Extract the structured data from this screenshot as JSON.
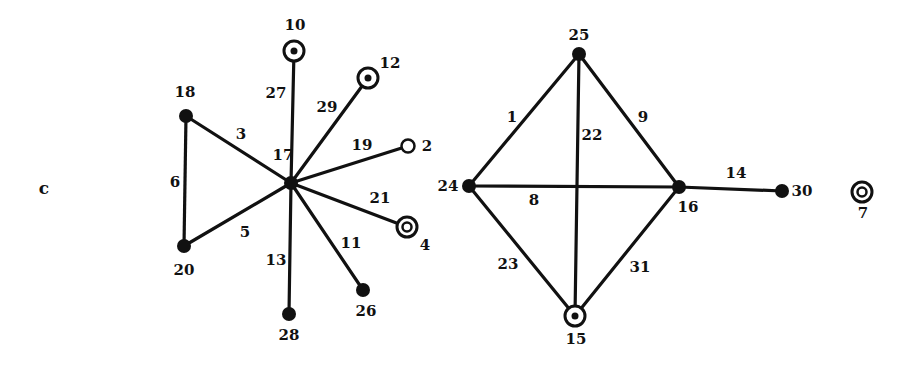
{
  "panel_label": "c",
  "colors": {
    "ink": "#111111",
    "background": "#ffffff"
  },
  "node_types": {
    "filled": "solid black dot",
    "dotted-ring": "ring with central dot",
    "double-ring": "double concentric ring",
    "open": "open circle"
  },
  "nodes": [
    {
      "id": "17",
      "label": "17",
      "type": "filled",
      "x": 291,
      "y": 183,
      "lx": 283,
      "ly": 160
    },
    {
      "id": "18",
      "label": "18",
      "type": "filled",
      "x": 186,
      "y": 116,
      "lx": 185,
      "ly": 97
    },
    {
      "id": "20",
      "label": "20",
      "type": "filled",
      "x": 184,
      "y": 246,
      "lx": 184,
      "ly": 275
    },
    {
      "id": "10",
      "label": "10",
      "type": "dotted-ring",
      "x": 294,
      "y": 51,
      "lx": 295,
      "ly": 30
    },
    {
      "id": "12",
      "label": "12",
      "type": "dotted-ring",
      "x": 368,
      "y": 78,
      "lx": 390,
      "ly": 68
    },
    {
      "id": "2",
      "label": "2",
      "type": "open",
      "x": 408,
      "y": 146,
      "lx": 427,
      "ly": 151
    },
    {
      "id": "4",
      "label": "4",
      "type": "double-ring",
      "x": 407,
      "y": 227,
      "lx": 425,
      "ly": 250
    },
    {
      "id": "26",
      "label": "26",
      "type": "filled",
      "x": 363,
      "y": 290,
      "lx": 366,
      "ly": 316
    },
    {
      "id": "28",
      "label": "28",
      "type": "filled",
      "x": 289,
      "y": 314,
      "lx": 289,
      "ly": 340
    },
    {
      "id": "25",
      "label": "25",
      "type": "filled",
      "x": 579,
      "y": 54,
      "lx": 579,
      "ly": 40
    },
    {
      "id": "24",
      "label": "24",
      "type": "filled",
      "x": 469,
      "y": 186,
      "lx": 448,
      "ly": 191
    },
    {
      "id": "16",
      "label": "16",
      "type": "filled",
      "x": 679,
      "y": 187,
      "lx": 688,
      "ly": 212
    },
    {
      "id": "15",
      "label": "15",
      "type": "dotted-ring",
      "x": 575,
      "y": 316,
      "lx": 576,
      "ly": 344
    },
    {
      "id": "30",
      "label": "30",
      "type": "filled",
      "x": 782,
      "y": 191,
      "lx": 802,
      "ly": 196
    },
    {
      "id": "7",
      "label": "7",
      "type": "double-ring",
      "x": 862,
      "y": 192,
      "lx": 863,
      "ly": 218
    }
  ],
  "edges": [
    {
      "id": "3",
      "label": "3",
      "from": "18",
      "to": "17",
      "lx": 241,
      "ly": 139
    },
    {
      "id": "6",
      "label": "6",
      "from": "18",
      "to": "20",
      "lx": 175,
      "ly": 187
    },
    {
      "id": "5",
      "label": "5",
      "from": "20",
      "to": "17",
      "lx": 245,
      "ly": 237
    },
    {
      "id": "27",
      "label": "27",
      "from": "10",
      "to": "17",
      "lx": 276,
      "ly": 98
    },
    {
      "id": "29",
      "label": "29",
      "from": "12",
      "to": "17",
      "lx": 327,
      "ly": 112
    },
    {
      "id": "19",
      "label": "19",
      "from": "2",
      "to": "17",
      "lx": 362,
      "ly": 150
    },
    {
      "id": "21",
      "label": "21",
      "from": "4",
      "to": "17",
      "lx": 380,
      "ly": 203
    },
    {
      "id": "11",
      "label": "11",
      "from": "26",
      "to": "17",
      "lx": 351,
      "ly": 248
    },
    {
      "id": "13",
      "label": "13",
      "from": "28",
      "to": "17",
      "lx": 276,
      "ly": 265
    },
    {
      "id": "1",
      "label": "1",
      "from": "24",
      "to": "25",
      "lx": 512,
      "ly": 122
    },
    {
      "id": "9",
      "label": "9",
      "from": "25",
      "to": "16",
      "lx": 643,
      "ly": 122
    },
    {
      "id": "22",
      "label": "22",
      "from": "25",
      "to": "15",
      "lx": 592,
      "ly": 140
    },
    {
      "id": "8",
      "label": "8",
      "from": "24",
      "to": "16",
      "lx": 534,
      "ly": 205
    },
    {
      "id": "23",
      "label": "23",
      "from": "24",
      "to": "15",
      "lx": 508,
      "ly": 269
    },
    {
      "id": "31",
      "label": "31",
      "from": "16",
      "to": "15",
      "lx": 640,
      "ly": 272
    },
    {
      "id": "14",
      "label": "14",
      "from": "16",
      "to": "30",
      "lx": 736,
      "ly": 178
    }
  ]
}
